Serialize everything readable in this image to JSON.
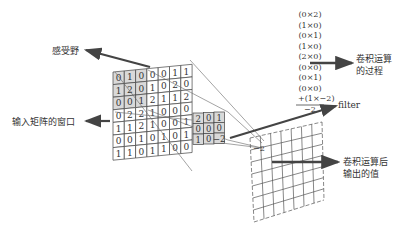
{
  "labels": {
    "receptive_field": "感受野",
    "input_window": "输入矩阵的窗口",
    "filter": "filter",
    "conv_process_l1": "卷积运算",
    "conv_process_l2": "的过程",
    "output_l1": "卷积运算后",
    "output_l2": "输出的值"
  },
  "input_matrix": [
    [
      0,
      1,
      0,
      0,
      0,
      1,
      1
    ],
    [
      1,
      2,
      0,
      1,
      0,
      2,
      0
    ],
    [
      0,
      0,
      1,
      2,
      1,
      1,
      2
    ],
    [
      0,
      2,
      2,
      1,
      0,
      0,
      0
    ],
    [
      1,
      1,
      2,
      1,
      0,
      0,
      1
    ],
    [
      0,
      0,
      1,
      0,
      1,
      0,
      1
    ],
    [
      1,
      1,
      0,
      1,
      1,
      0,
      0
    ]
  ],
  "filter_matrix": [
    [
      2,
      0,
      1
    ],
    [
      0,
      0,
      0
    ],
    [
      1,
      0,
      -2
    ]
  ],
  "calculation": {
    "terms": [
      "(0×2)",
      "(1×0)",
      "(0×1)",
      "(1×0)",
      "(2×0)",
      "(0×0)",
      "(0×1)",
      "(0×0)",
      "+(1×−2)"
    ],
    "result": "−2"
  },
  "output_value": "−2",
  "colors": {
    "highlight": "#d9d9d9",
    "line": "#444444",
    "arrow": "#444444"
  }
}
